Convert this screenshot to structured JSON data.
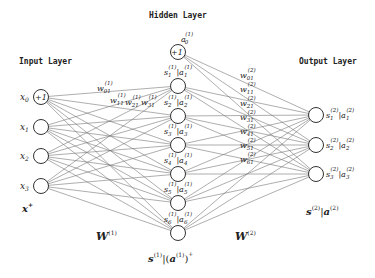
{
  "titles": {
    "input": "Input Layer",
    "hidden": "Hidden Layer",
    "output": "Output Layer"
  },
  "input_nodes": [
    {
      "label": "x",
      "sub": "0",
      "bias": "+1"
    },
    {
      "label": "x",
      "sub": "1"
    },
    {
      "label": "x",
      "sub": "2"
    },
    {
      "label": "x",
      "sub": "3"
    }
  ],
  "hidden_bias": {
    "label": "a",
    "sub": "0",
    "sup": "(1)",
    "text": "+1"
  },
  "hidden_nodes": [
    {
      "s": "s",
      "a": "a",
      "sub": "1",
      "sup": "(1)"
    },
    {
      "s": "s",
      "a": "a",
      "sub": "2",
      "sup": "(1)"
    },
    {
      "s": "s",
      "a": "a",
      "sub": "3",
      "sup": "(1)"
    },
    {
      "s": "s",
      "a": "a",
      "sub": "4",
      "sup": "(1)"
    },
    {
      "s": "s",
      "a": "a",
      "sub": "5",
      "sup": "(1)"
    },
    {
      "s": "s",
      "a": "a",
      "sub": "6",
      "sup": "(1)"
    }
  ],
  "output_nodes": [
    {
      "s": "s",
      "a": "a",
      "sub": "1",
      "sup": "(2)"
    },
    {
      "s": "s",
      "a": "a",
      "sub": "2",
      "sup": "(2)"
    },
    {
      "s": "s",
      "a": "a",
      "sub": "3",
      "sup": "(2)"
    }
  ],
  "weights_layer1": [
    {
      "w": "w",
      "sub": "01",
      "sup": "(1)"
    },
    {
      "w": "w",
      "sub": "11",
      "sup": "(1)"
    },
    {
      "w": "w",
      "sub": "21",
      "sup": "(1)"
    },
    {
      "w": "w",
      "sub": "31",
      "sup": "(1)"
    }
  ],
  "weights_layer2": [
    {
      "w": "w",
      "sub": "01",
      "sup": "(2)"
    },
    {
      "w": "w",
      "sub": "11",
      "sup": "(2)"
    },
    {
      "w": "w",
      "sub": "21",
      "sup": "(2)"
    },
    {
      "w": "w",
      "sub": "31",
      "sup": "(2)"
    },
    {
      "w": "w",
      "sub": "41",
      "sup": "(2)"
    },
    {
      "w": "w",
      "sub": "51",
      "sup": "(2)"
    },
    {
      "w": "w",
      "sub": "61",
      "sup": "(2)"
    }
  ],
  "captions": {
    "input_vec": "x",
    "input_vec_sup": "+",
    "W1": "W",
    "W1_sup": "(1)",
    "W2": "W",
    "W2_sup": "(2)",
    "hidden_vec_s": "s",
    "hidden_vec_sup": "(1)",
    "hidden_vec_a": "a",
    "hidden_vec_plus": "+",
    "output_vec_s": "s",
    "output_vec_a": "a",
    "output_vec_sup": "(2)"
  }
}
